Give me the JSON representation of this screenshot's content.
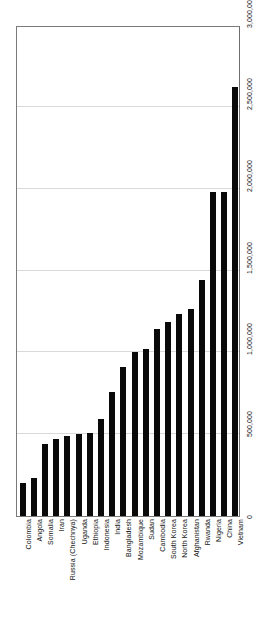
{
  "chart_data": {
    "type": "bar",
    "title": "",
    "subtitle": "",
    "xlabel": "",
    "ylabel": "",
    "orientation": "vertical",
    "grid": true,
    "legend": false,
    "ylim": [
      0,
      3000000
    ],
    "ytick_labels": [
      "0",
      "500,000",
      "1,000,000",
      "1,500,000",
      "2,000,000",
      "2,500,000",
      "3,000,000"
    ],
    "ytick_values": [
      0,
      500000,
      1000000,
      1500000,
      2000000,
      2500000,
      3000000
    ],
    "bar_color": "#0a0a0a",
    "categories": [
      "Colombia",
      "Angola",
      "Somalia",
      "Iran",
      "Russia (Chechnya)",
      "Uganda",
      "Ethiopia",
      "Indonesia",
      "India",
      "Bangladesh",
      "Mozambique",
      "Sudan",
      "Cambodia",
      "South Korea",
      "North Korea",
      "Afghanistan",
      "Rwanda",
      "Nigeria",
      "China",
      "Vietnam"
    ],
    "values": [
      200000,
      230000,
      440000,
      470000,
      490000,
      500000,
      510000,
      590000,
      760000,
      910000,
      1000000,
      1020000,
      1140000,
      1185000,
      1235000,
      1265000,
      1440000,
      1980000,
      1980000,
      2620000
    ]
  }
}
